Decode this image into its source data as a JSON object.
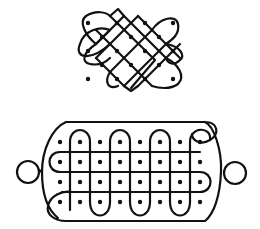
{
  "figure": {
    "colors": {
      "background": "#ffffff",
      "line": "#111111",
      "dot": "#111111"
    }
  },
  "top_kolam": {
    "dot_grid": [
      [
        88,
        23
      ],
      [
        117,
        23
      ],
      [
        145,
        23
      ],
      [
        173,
        23
      ],
      [
        102,
        37
      ],
      [
        131,
        37
      ],
      [
        159,
        37
      ],
      [
        88,
        51
      ],
      [
        117,
        51
      ],
      [
        145,
        51
      ],
      [
        173,
        51
      ],
      [
        102,
        65
      ],
      [
        131,
        65
      ],
      [
        159,
        65
      ],
      [
        88,
        79
      ],
      [
        117,
        79
      ],
      [
        145,
        79
      ],
      [
        173,
        79
      ]
    ]
  },
  "bottom_kolam": {
    "dot_columns": [
      60,
      80,
      100,
      120,
      140,
      160,
      180,
      200
    ],
    "dot_rows": [
      142,
      162,
      182,
      202
    ],
    "side_loops": [
      "left-loop",
      "right-loop"
    ]
  }
}
